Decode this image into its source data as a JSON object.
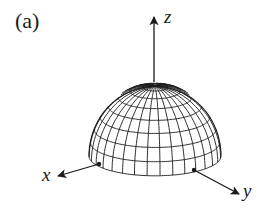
{
  "figure": {
    "panel_label": "(a)",
    "axes": {
      "z_label": "z",
      "x_label": "x",
      "y_label": "y"
    },
    "surface": {
      "type": "hemisphere",
      "meridians": 32,
      "parallels": 8
    },
    "colors": {
      "line": "#1a1a1a",
      "background": "#ffffff"
    }
  }
}
